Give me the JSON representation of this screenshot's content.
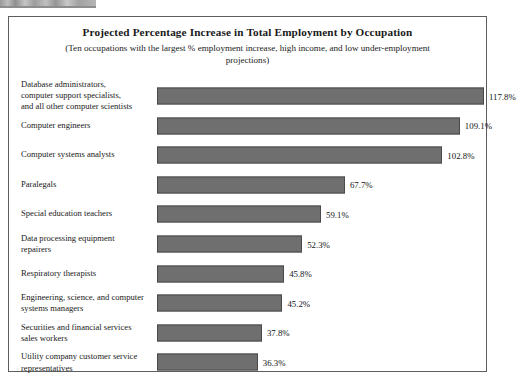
{
  "chart_data": {
    "type": "bar",
    "orientation": "horizontal",
    "title": "Projected Percentage Increase in Total Employment by Occupation",
    "subtitle": "(Ten occupations with the largest % employment increase, high income,\nand low under-employment projections)",
    "xlabel": "",
    "ylabel": "",
    "xlim": [
      0,
      117.8
    ],
    "grid": false,
    "legend": false,
    "value_suffix": "%",
    "bar_color": "#6f6f6f",
    "bar_border_color": "#4a4a4a",
    "categories": [
      "Database administrators,\ncomputer support specialists,\nand all other computer scientists",
      "Computer engineers",
      "Computer systems analysts",
      "Paralegals",
      "Special education teachers",
      "Data processing equipment\nrepairers",
      "Respiratory therapists",
      "Engineering, science, and computer\nsystems managers",
      "Securities and financial services\nsales workers",
      "Utility company customer service\nrepresentatives"
    ],
    "values": [
      117.8,
      109.1,
      102.8,
      67.7,
      59.1,
      52.3,
      45.8,
      45.2,
      37.8,
      36.3
    ],
    "value_labels": [
      "117.8%",
      "109.1%",
      "102.8%",
      "67.7%",
      "59.1%",
      "52.3%",
      "45.8%",
      "45.2%",
      "37.8%",
      "36.3%"
    ]
  }
}
